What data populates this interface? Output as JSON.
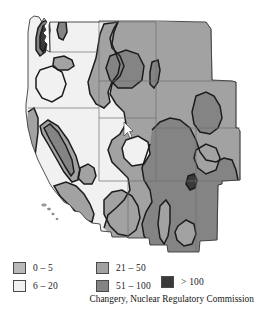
{
  "figure": {
    "kind": "choropleth-contour-map",
    "region": "Western United States",
    "unit_note": "",
    "cursor_marker": "white-arrow-marker"
  },
  "legend": {
    "items": [
      {
        "label": "0 – 5",
        "color": "#b9b9b9",
        "name": "legend-swatch-0-5"
      },
      {
        "label": "6 – 20",
        "color": "#f1f1f1",
        "name": "legend-swatch-6-20"
      },
      {
        "label": "21 – 50",
        "color": "#a2a2a2",
        "name": "legend-swatch-21-50"
      },
      {
        "label": "51 – 100",
        "color": "#848484",
        "name": "legend-swatch-51-100"
      },
      {
        "label": "> 100",
        "color": "#3a3a3a",
        "name": "legend-swatch-over-100"
      }
    ]
  },
  "attribution": {
    "text": "Changery, Nuclear Regulatory Commission"
  },
  "colors": {
    "outline": "#1c1c1c",
    "state_border": "#6d6d6d",
    "background": "#ffffff",
    "band_0_5": "#b9b9b9",
    "band_6_20": "#f1f1f1",
    "band_21_50": "#a2a2a2",
    "band_51_100": "#848484",
    "band_over_100": "#3a3a3a"
  }
}
